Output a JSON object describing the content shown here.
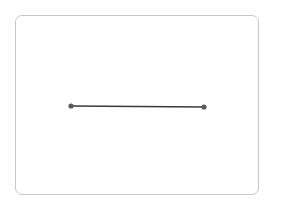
{
  "diagram": {
    "type": "line-segment",
    "frame": {
      "x": 15,
      "y": 15,
      "width": 244,
      "height": 180,
      "radius": 7,
      "stroke": "#c8c8c8"
    },
    "segment": {
      "start": {
        "x": 71,
        "y": 106
      },
      "end": {
        "x": 204,
        "y": 107
      },
      "stroke": "#3a3a3a",
      "stroke_width": 1.6
    },
    "endpoints": [
      {
        "name": "start-point",
        "x": 71,
        "y": 106,
        "r": 2.6,
        "fill": "#5a5a5a"
      },
      {
        "name": "end-point",
        "x": 204,
        "y": 107,
        "r": 2.6,
        "fill": "#5a5a5a"
      }
    ]
  }
}
